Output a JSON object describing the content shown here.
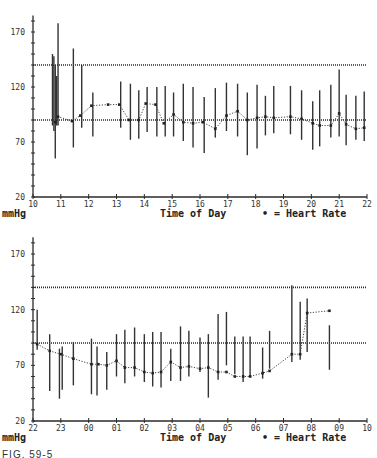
{
  "figure_caption": "FIG. 59-5",
  "chart_data": [
    {
      "type": "line",
      "title": "",
      "xlabel": "Time of Day",
      "ylabel": "mmHg",
      "legend": "• = Heart Rate",
      "ylim": [
        20,
        180
      ],
      "yticks": [
        20,
        70,
        120,
        170
      ],
      "xticks": [
        "10",
        "11",
        "12",
        "13",
        "14",
        "15",
        "16",
        "17",
        "18",
        "19",
        "20",
        "21",
        "22"
      ],
      "xrange": [
        10,
        22
      ],
      "reference_lines": [
        140,
        90
      ],
      "grid": false,
      "bp_ranges": [
        {
          "x": 10.7,
          "low": 85,
          "high": 150
        },
        {
          "x": 10.75,
          "low": 80,
          "high": 148
        },
        {
          "x": 10.8,
          "low": 55,
          "high": 140
        },
        {
          "x": 10.85,
          "low": 85,
          "high": 130
        },
        {
          "x": 10.9,
          "low": 85,
          "high": 178
        },
        {
          "x": 11.45,
          "low": 65,
          "high": 155
        },
        {
          "x": 11.75,
          "low": 83,
          "high": 140
        },
        {
          "x": 12.15,
          "low": 75,
          "high": 115
        },
        {
          "x": 13.15,
          "low": 83,
          "high": 125
        },
        {
          "x": 13.5,
          "low": 72,
          "high": 123
        },
        {
          "x": 13.8,
          "low": 73,
          "high": 117
        },
        {
          "x": 14.1,
          "low": 79,
          "high": 120
        },
        {
          "x": 14.45,
          "low": 75,
          "high": 120
        },
        {
          "x": 14.75,
          "low": 75,
          "high": 121
        },
        {
          "x": 15.05,
          "low": 75,
          "high": 115
        },
        {
          "x": 15.4,
          "low": 71,
          "high": 123
        },
        {
          "x": 15.75,
          "low": 65,
          "high": 120
        },
        {
          "x": 16.15,
          "low": 60,
          "high": 111
        },
        {
          "x": 16.55,
          "low": 74,
          "high": 119
        },
        {
          "x": 16.95,
          "low": 80,
          "high": 124
        },
        {
          "x": 17.35,
          "low": 75,
          "high": 123
        },
        {
          "x": 17.7,
          "low": 58,
          "high": 115
        },
        {
          "x": 18.05,
          "low": 64,
          "high": 122
        },
        {
          "x": 18.35,
          "low": 76,
          "high": 112
        },
        {
          "x": 18.65,
          "low": 78,
          "high": 121
        },
        {
          "x": 19.25,
          "low": 77,
          "high": 121
        },
        {
          "x": 19.65,
          "low": 72,
          "high": 117
        },
        {
          "x": 20.05,
          "low": 63,
          "high": 107
        },
        {
          "x": 20.3,
          "low": 66,
          "high": 117
        },
        {
          "x": 20.7,
          "low": 74,
          "high": 122
        },
        {
          "x": 21.0,
          "low": 75,
          "high": 136
        },
        {
          "x": 21.25,
          "low": 67,
          "high": 113
        },
        {
          "x": 21.6,
          "low": 72,
          "high": 112
        },
        {
          "x": 21.9,
          "low": 71,
          "high": 116
        }
      ],
      "heart_rate": [
        {
          "x": 10.8,
          "y": 88
        },
        {
          "x": 10.9,
          "y": 93
        },
        {
          "x": 11.4,
          "y": 89
        },
        {
          "x": 11.7,
          "y": 94
        },
        {
          "x": 12.1,
          "y": 103
        },
        {
          "x": 12.7,
          "y": 104
        },
        {
          "x": 13.1,
          "y": 104
        },
        {
          "x": 13.45,
          "y": 90
        },
        {
          "x": 13.8,
          "y": 90
        },
        {
          "x": 14.05,
          "y": 105
        },
        {
          "x": 14.4,
          "y": 104
        },
        {
          "x": 14.7,
          "y": 87
        },
        {
          "x": 15.05,
          "y": 95
        },
        {
          "x": 15.4,
          "y": 88
        },
        {
          "x": 15.75,
          "y": 87
        },
        {
          "x": 16.1,
          "y": 88
        },
        {
          "x": 16.55,
          "y": 82
        },
        {
          "x": 16.95,
          "y": 94
        },
        {
          "x": 17.35,
          "y": 98
        },
        {
          "x": 17.7,
          "y": 90
        },
        {
          "x": 18.05,
          "y": 92
        },
        {
          "x": 18.35,
          "y": 93
        },
        {
          "x": 18.65,
          "y": 92
        },
        {
          "x": 19.25,
          "y": 93
        },
        {
          "x": 19.65,
          "y": 91
        },
        {
          "x": 20.05,
          "y": 87
        },
        {
          "x": 20.3,
          "y": 85
        },
        {
          "x": 20.7,
          "y": 85
        },
        {
          "x": 21.0,
          "y": 96
        },
        {
          "x": 21.25,
          "y": 86
        },
        {
          "x": 21.6,
          "y": 82
        },
        {
          "x": 21.9,
          "y": 83
        }
      ]
    },
    {
      "type": "line",
      "title": "",
      "xlabel": "Time of Day",
      "ylabel": "mmHg",
      "legend": "• = Heart Rate",
      "ylim": [
        20,
        180
      ],
      "yticks": [
        20,
        70,
        120,
        170
      ],
      "xticks": [
        "22",
        "23",
        "00",
        "01",
        "02",
        "03",
        "04",
        "05",
        "06",
        "07",
        "08",
        "09",
        "10"
      ],
      "xrange": [
        22,
        34
      ],
      "reference_lines": [
        140,
        90
      ],
      "grid": false,
      "bp_ranges": [
        {
          "x": 22.15,
          "low": 84,
          "high": 120
        },
        {
          "x": 22.6,
          "low": 47,
          "high": 98
        },
        {
          "x": 22.95,
          "low": 40,
          "high": 85
        },
        {
          "x": 23.05,
          "low": 48,
          "high": 87
        },
        {
          "x": 23.45,
          "low": 52,
          "high": 91
        },
        {
          "x": 24.1,
          "low": 44,
          "high": 94
        },
        {
          "x": 24.3,
          "low": 43,
          "high": 87
        },
        {
          "x": 24.65,
          "low": 48,
          "high": 82
        },
        {
          "x": 25.0,
          "low": 60,
          "high": 98
        },
        {
          "x": 25.3,
          "low": 54,
          "high": 102
        },
        {
          "x": 25.65,
          "low": 60,
          "high": 104
        },
        {
          "x": 26.0,
          "low": 55,
          "high": 98
        },
        {
          "x": 26.3,
          "low": 51,
          "high": 100
        },
        {
          "x": 26.6,
          "low": 50,
          "high": 100
        },
        {
          "x": 26.95,
          "low": 56,
          "high": 85
        },
        {
          "x": 27.3,
          "low": 56,
          "high": 105
        },
        {
          "x": 27.6,
          "low": 60,
          "high": 101
        },
        {
          "x": 28.0,
          "low": 64,
          "high": 95
        },
        {
          "x": 28.3,
          "low": 41,
          "high": 98
        },
        {
          "x": 28.65,
          "low": 57,
          "high": 116
        },
        {
          "x": 28.95,
          "low": 70,
          "high": 118
        },
        {
          "x": 29.25,
          "low": 62,
          "high": 96
        },
        {
          "x": 29.55,
          "low": 55,
          "high": 96
        },
        {
          "x": 29.8,
          "low": 60,
          "high": 96
        },
        {
          "x": 30.25,
          "low": 58,
          "high": 86
        },
        {
          "x": 30.5,
          "low": 67,
          "high": 101
        },
        {
          "x": 31.3,
          "low": 73,
          "high": 142
        },
        {
          "x": 31.6,
          "low": 75,
          "high": 127
        },
        {
          "x": 31.85,
          "low": 82,
          "high": 130
        },
        {
          "x": 32.65,
          "low": 66,
          "high": 106
        }
      ],
      "heart_rate": [
        {
          "x": 22.15,
          "y": 89
        },
        {
          "x": 22.6,
          "y": 83
        },
        {
          "x": 23.0,
          "y": 80
        },
        {
          "x": 23.45,
          "y": 76
        },
        {
          "x": 24.1,
          "y": 71
        },
        {
          "x": 24.35,
          "y": 71
        },
        {
          "x": 24.65,
          "y": 70
        },
        {
          "x": 25.0,
          "y": 74
        },
        {
          "x": 25.3,
          "y": 68
        },
        {
          "x": 25.65,
          "y": 68
        },
        {
          "x": 26.0,
          "y": 64
        },
        {
          "x": 26.3,
          "y": 63
        },
        {
          "x": 26.6,
          "y": 64
        },
        {
          "x": 26.95,
          "y": 73
        },
        {
          "x": 27.3,
          "y": 68
        },
        {
          "x": 27.6,
          "y": 69
        },
        {
          "x": 28.0,
          "y": 67
        },
        {
          "x": 28.3,
          "y": 68
        },
        {
          "x": 28.65,
          "y": 64
        },
        {
          "x": 28.95,
          "y": 64
        },
        {
          "x": 29.25,
          "y": 60
        },
        {
          "x": 29.55,
          "y": 60
        },
        {
          "x": 29.8,
          "y": 60
        },
        {
          "x": 30.25,
          "y": 63
        },
        {
          "x": 30.5,
          "y": 65
        },
        {
          "x": 31.3,
          "y": 80
        },
        {
          "x": 31.6,
          "y": 80
        },
        {
          "x": 31.85,
          "y": 117
        },
        {
          "x": 32.65,
          "y": 119
        }
      ]
    }
  ],
  "panels": [
    {
      "ylabel": "mmHg",
      "xlabel": "Time of Day",
      "legend": "• = Heart Rate"
    },
    {
      "ylabel": "mmHg",
      "xlabel": "Time of Day",
      "legend": "• = Heart Rate"
    }
  ]
}
